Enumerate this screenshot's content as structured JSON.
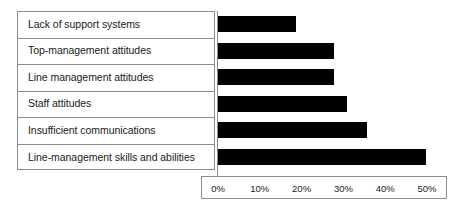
{
  "chart_data": {
    "type": "bar",
    "orientation": "horizontal",
    "title": "",
    "xlabel": "",
    "ylabel": "",
    "grid": false,
    "legend": null,
    "xlim": [
      0,
      50
    ],
    "xunit": "%",
    "xticks": [
      "0%",
      "10%",
      "20%",
      "30%",
      "40%",
      "50%"
    ],
    "xtick_values": [
      0,
      10,
      20,
      30,
      40,
      50
    ],
    "categories": [
      "Lack of support systems",
      "Top-management attitudes",
      "Line management attitudes",
      "Staff attitudes",
      "Insufficient communications",
      "Line-management skills and abilities"
    ],
    "values": [
      19,
      28,
      28,
      31,
      36,
      50
    ],
    "bar_color": "#000000",
    "border_color": "#8c8c8c",
    "background_color": "#ffffff"
  }
}
